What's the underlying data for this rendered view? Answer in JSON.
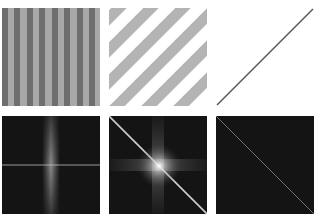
{
  "figure": {
    "layout": {
      "rows": 2,
      "cols": 3
    },
    "colors": {
      "background": "#ffffff",
      "stripe_dark": "#6e6e6e",
      "stripe_light": "#a8a8a8",
      "diag_stripe": "#b4b4b4",
      "line": "#555555",
      "spectrum_bg": "#141414"
    },
    "panels": [
      {
        "row": 0,
        "col": 0,
        "content": "vertical-stripes",
        "stripe_count": 8
      },
      {
        "row": 0,
        "col": 1,
        "content": "diagonal-stripes",
        "stripe_count": 4
      },
      {
        "row": 0,
        "col": 2,
        "content": "diagonal-line"
      },
      {
        "row": 1,
        "col": 0,
        "content": "fourier-spectrum-vertical-band"
      },
      {
        "row": 1,
        "col": 1,
        "content": "fourier-spectrum-diagonal-with-cross"
      },
      {
        "row": 1,
        "col": 2,
        "content": "fourier-spectrum-diagonal-line"
      }
    ]
  }
}
